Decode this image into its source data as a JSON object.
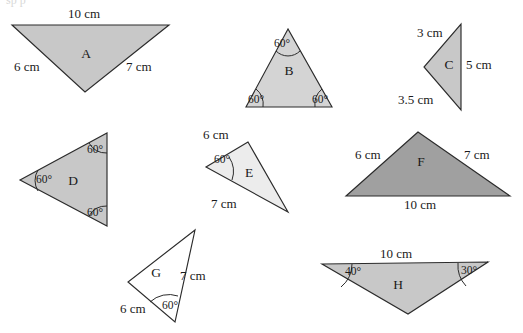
{
  "page": {
    "background_color": "#ffffff",
    "width": 523,
    "height": 333,
    "cut_off_header_text": "sp      p"
  },
  "palette": {
    "outline": "#2b2b2b",
    "text": "#1a1a1a",
    "fill_medium_gray": "#c8c8c8",
    "fill_light_gray": "#d4d4d4",
    "fill_dark_gray": "#a0a0a0",
    "fill_very_light_gray": "#ececec",
    "fill_white": "#ffffff"
  },
  "units": "cm",
  "degree_symbol": "°",
  "triangles": [
    {
      "id": "A",
      "label": "A",
      "fill": "#c8c8c8",
      "points": "12,25 169,25 85,92",
      "label_pos": {
        "x": 86,
        "y": 55
      },
      "side_labels": [
        {
          "text": "10 cm",
          "x": 68,
          "y": 15
        },
        {
          "text": "6 cm",
          "x": 14,
          "y": 68
        },
        {
          "text": "7 cm",
          "x": 126,
          "y": 68
        }
      ],
      "angle_labels": [],
      "angle_arcs": []
    },
    {
      "id": "B",
      "label": "B",
      "fill": "#d4d4d4",
      "points": "288,29 246,107 332,107",
      "label_pos": {
        "x": 289,
        "y": 72
      },
      "side_labels": [],
      "angle_labels": [
        {
          "text": "60°",
          "x": 274,
          "y": 44
        },
        {
          "text": "60°",
          "x": 248,
          "y": 100
        },
        {
          "text": "60°",
          "x": 312,
          "y": 100
        }
      ],
      "angle_arcs": [
        {
          "d": "M 276,51 A 17,17 0 0 0 300,51"
        },
        {
          "d": "M 263,107 A 20,20 0 0 0 256,89"
        },
        {
          "d": "M 315,107 A 20,20 0 0 1 322,89"
        }
      ]
    },
    {
      "id": "C",
      "label": "C",
      "fill": "#c8c8c8",
      "points": "461,24 461,110 424,67",
      "label_pos": {
        "x": 449,
        "y": 66
      },
      "side_labels": [
        {
          "text": "3 cm",
          "x": 417,
          "y": 34
        },
        {
          "text": "5 cm",
          "x": 466,
          "y": 66
        },
        {
          "text": "3.5 cm",
          "x": 398,
          "y": 101
        }
      ],
      "angle_labels": [],
      "angle_arcs": []
    },
    {
      "id": "D",
      "label": "D",
      "fill": "#c8c8c8",
      "points": "107,133 107,226 20,180",
      "label_pos": {
        "x": 73,
        "y": 182
      },
      "side_labels": [],
      "angle_labels": [
        {
          "text": "60°",
          "x": 87,
          "y": 150
        },
        {
          "text": "60°",
          "x": 36,
          "y": 180
        },
        {
          "text": "60°",
          "x": 87,
          "y": 213
        }
      ],
      "angle_arcs": [
        {
          "d": "M 107,153 A 20,20 0 0 1 89,143"
        },
        {
          "d": "M 38,170 A 20,20 0 0 0 38,191"
        },
        {
          "d": "M 89,216 A 20,20 0 0 1 107,206"
        }
      ]
    },
    {
      "id": "E",
      "label": "E",
      "fill": "#ececec",
      "points": "248,142 206,167 288,212",
      "label_pos": {
        "x": 249,
        "y": 174
      },
      "side_labels": [
        {
          "text": "6 cm",
          "x": 203,
          "y": 136
        },
        {
          "text": "7 cm",
          "x": 211,
          "y": 205
        }
      ],
      "angle_labels": [
        {
          "text": "60°",
          "x": 214,
          "y": 160
        }
      ],
      "angle_arcs": [
        {
          "d": "M 229,157 A 26,26 0 0 1 232,180"
        }
      ]
    },
    {
      "id": "F",
      "label": "F",
      "fill": "#a0a0a0",
      "points": "418,132 346,196 510,196",
      "label_pos": {
        "x": 421,
        "y": 163
      },
      "side_labels": [
        {
          "text": "6 cm",
          "x": 355,
          "y": 156
        },
        {
          "text": "7 cm",
          "x": 464,
          "y": 156
        },
        {
          "text": "10 cm",
          "x": 404,
          "y": 206
        }
      ],
      "angle_labels": [],
      "angle_arcs": []
    },
    {
      "id": "G",
      "label": "G",
      "fill": "#ffffff",
      "points": "195,230 128,282 175,322",
      "label_pos": {
        "x": 156,
        "y": 274
      },
      "side_labels": [
        {
          "text": "6 cm",
          "x": 120,
          "y": 310
        },
        {
          "text": "7 cm",
          "x": 180,
          "y": 277
        }
      ],
      "angle_labels": [
        {
          "text": "60°",
          "x": 162,
          "y": 306
        }
      ],
      "angle_arcs": [
        {
          "d": "M 150,302 A 28,28 0 0 1 178,296"
        }
      ]
    },
    {
      "id": "H",
      "label": "H",
      "fill": "#c8c8c8",
      "points": "322,264 488,262 408,314",
      "label_pos": {
        "x": 398,
        "y": 286
      },
      "side_labels": [
        {
          "text": "10 cm",
          "x": 380,
          "y": 255
        }
      ],
      "angle_labels": [
        {
          "text": "40°",
          "x": 345,
          "y": 272
        },
        {
          "text": "30°",
          "x": 461,
          "y": 271
        }
      ],
      "angle_arcs": [
        {
          "d": "M 352,264 A 30,30 0 0 1 341,287"
        },
        {
          "d": "M 458,263 A 30,30 0 0 0 466,286"
        }
      ]
    }
  ]
}
